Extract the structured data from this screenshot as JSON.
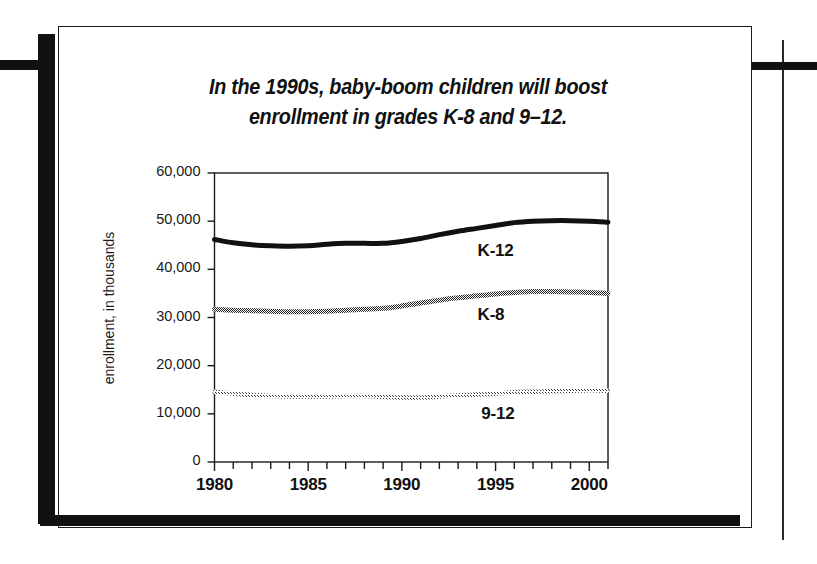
{
  "figure": {
    "title_lines": [
      "In the 1990s, baby-boom children will boost",
      "enrollment in grades K-8 and 9–12."
    ]
  },
  "chart_data": {
    "type": "line",
    "title": "In the 1990s, baby-boom children will boost enrollment in grades K-8 and 9–12.",
    "xlabel": "",
    "ylabel": "enrollment, in thousands",
    "xlim": [
      1980,
      2001
    ],
    "ylim": [
      0,
      60000
    ],
    "grid": false,
    "legend_position": "inline-labels",
    "x_tick_labels": [
      "1980",
      "1985",
      "1990",
      "1995",
      "2000"
    ],
    "x_tick_values": [
      1980,
      1985,
      1990,
      1995,
      2000
    ],
    "x_minor_tick_values": [
      1980,
      1981,
      1982,
      1983,
      1984,
      1985,
      1986,
      1987,
      1988,
      1989,
      1990,
      1991,
      1992,
      1993,
      1994,
      1995,
      1996,
      1997,
      1998,
      1999,
      2000,
      2001
    ],
    "y_tick_labels": [
      "0",
      "10,000",
      "20,000",
      "30,000",
      "40,000",
      "50,000",
      "60,000"
    ],
    "y_tick_values": [
      0,
      10000,
      20000,
      30000,
      40000,
      50000,
      60000
    ],
    "x": [
      1980,
      1981,
      1982,
      1983,
      1984,
      1985,
      1986,
      1987,
      1988,
      1989,
      1990,
      1991,
      1992,
      1993,
      1994,
      1995,
      1996,
      1997,
      1998,
      1999,
      2000,
      2001
    ],
    "series": [
      {
        "name": "K-12",
        "label": "K-12",
        "color": "#111111",
        "style": "solid-thick",
        "values": [
          46200,
          45500,
          45100,
          44900,
          44800,
          44900,
          45200,
          45400,
          45400,
          45400,
          45800,
          46400,
          47200,
          47900,
          48500,
          49100,
          49700,
          50000,
          50100,
          50100,
          50000,
          49800
        ]
      },
      {
        "name": "K-8",
        "label": "K-8",
        "color": "#4d4d4d",
        "style": "halftone-dark",
        "values": [
          31700,
          31500,
          31400,
          31300,
          31200,
          31200,
          31300,
          31500,
          31700,
          31900,
          32400,
          33000,
          33600,
          34100,
          34500,
          34900,
          35200,
          35400,
          35400,
          35300,
          35200,
          35000
        ]
      },
      {
        "name": "9-12",
        "label": "9-12",
        "color": "#b0b0b0",
        "style": "halftone-light",
        "values": [
          14600,
          14200,
          13900,
          13700,
          13600,
          13600,
          13600,
          13700,
          13700,
          13500,
          13400,
          13400,
          13600,
          13800,
          14000,
          14200,
          14500,
          14600,
          14700,
          14800,
          14900,
          14800
        ]
      }
    ],
    "series_label_positions": [
      {
        "name": "K-12",
        "x": 1995.0,
        "y": 43500
      },
      {
        "name": "K-8",
        "x": 1995.0,
        "y": 30400
      },
      {
        "name": "9-12",
        "x": 1995.2,
        "y": 9800
      }
    ]
  }
}
